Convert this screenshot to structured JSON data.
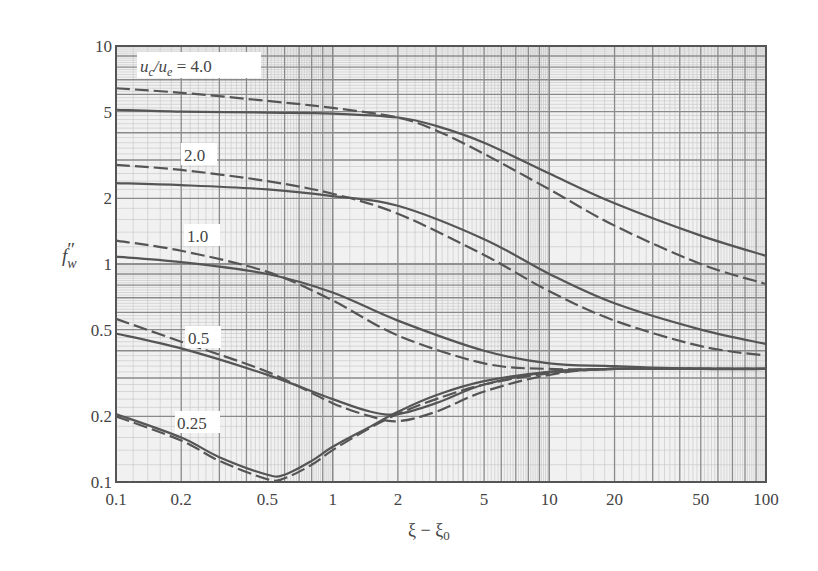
{
  "chart_data": {
    "type": "line",
    "title": "",
    "xlabel": "ξ − ξ0",
    "ylabel": "f''_w",
    "xscale": "log",
    "yscale": "log",
    "xlim": [
      0.1,
      100
    ],
    "ylim": [
      0.1,
      10
    ],
    "grid": true,
    "x_ticks": [
      "0.1",
      "0.2",
      "0.5",
      "1",
      "2",
      "5",
      "10",
      "20",
      "50",
      "100"
    ],
    "y_ticks": [
      "0.1",
      "0.2",
      "0.5",
      "1",
      "2",
      "5",
      "10"
    ],
    "legend_note": "Solid lines and dashed lines are paired for each u_c/u_e value",
    "curve_labels": [
      "u_c/u_e = 4.0",
      "2.0",
      "1.0",
      "0.5",
      "0.25"
    ],
    "series": [
      {
        "name": "u_c/u_e = 4.0 (solid)",
        "style": "solid",
        "x": [
          0.1,
          0.2,
          0.5,
          1,
          2,
          3,
          5,
          10,
          20,
          50,
          100
        ],
        "y": [
          5.1,
          5.0,
          4.95,
          4.9,
          4.7,
          4.3,
          3.6,
          2.6,
          1.9,
          1.35,
          1.09
        ]
      },
      {
        "name": "u_c/u_e = 4.0 (dashed)",
        "style": "dashed",
        "x": [
          0.1,
          0.2,
          0.5,
          1,
          2,
          3,
          5,
          10,
          20,
          50,
          100
        ],
        "y": [
          6.4,
          6.1,
          5.6,
          5.2,
          4.7,
          4.1,
          3.2,
          2.2,
          1.5,
          1.0,
          0.81
        ]
      },
      {
        "name": "u_c/u_e = 2.0 (solid)",
        "style": "solid",
        "x": [
          0.1,
          0.2,
          0.5,
          1,
          2,
          5,
          10,
          20,
          50,
          100
        ],
        "y": [
          2.35,
          2.3,
          2.2,
          2.05,
          1.85,
          1.3,
          0.9,
          0.66,
          0.5,
          0.43
        ]
      },
      {
        "name": "u_c/u_e = 2.0 (dashed)",
        "style": "dashed",
        "x": [
          0.1,
          0.2,
          0.5,
          1,
          2,
          5,
          10,
          20,
          50,
          100
        ],
        "y": [
          2.85,
          2.7,
          2.4,
          2.1,
          1.7,
          1.1,
          0.75,
          0.55,
          0.42,
          0.38
        ]
      },
      {
        "name": "u_c/u_e = 1.0 (solid)",
        "style": "solid",
        "x": [
          0.1,
          0.2,
          0.5,
          1,
          2,
          5,
          10,
          20,
          50,
          100
        ],
        "y": [
          1.08,
          1.02,
          0.9,
          0.74,
          0.55,
          0.4,
          0.35,
          0.34,
          0.33,
          0.33
        ]
      },
      {
        "name": "u_c/u_e = 1.0 (dashed)",
        "style": "dashed",
        "x": [
          0.1,
          0.2,
          0.5,
          1,
          2,
          5,
          10,
          20,
          50,
          100
        ],
        "y": [
          1.28,
          1.15,
          0.92,
          0.68,
          0.47,
          0.35,
          0.33,
          0.33,
          0.33,
          0.33
        ]
      },
      {
        "name": "u_c/u_e = 0.5 (solid)",
        "style": "solid",
        "x": [
          0.1,
          0.2,
          0.5,
          1,
          1.5,
          2,
          3,
          5,
          10,
          20,
          100
        ],
        "y": [
          0.48,
          0.41,
          0.31,
          0.24,
          0.21,
          0.205,
          0.23,
          0.28,
          0.32,
          0.33,
          0.33
        ]
      },
      {
        "name": "u_c/u_e = 0.5 (dashed)",
        "style": "dashed",
        "x": [
          0.1,
          0.2,
          0.5,
          1,
          1.5,
          2,
          3,
          5,
          10,
          20,
          100
        ],
        "y": [
          0.56,
          0.44,
          0.32,
          0.23,
          0.2,
          0.19,
          0.21,
          0.26,
          0.31,
          0.33,
          0.33
        ]
      },
      {
        "name": "u_c/u_e = 0.25 (solid)",
        "style": "solid",
        "x": [
          0.1,
          0.2,
          0.3,
          0.5,
          0.6,
          0.8,
          1,
          1.5,
          2,
          3,
          5,
          10,
          20,
          100
        ],
        "y": [
          0.205,
          0.16,
          0.13,
          0.108,
          0.108,
          0.125,
          0.145,
          0.18,
          0.21,
          0.25,
          0.29,
          0.32,
          0.33,
          0.33
        ]
      },
      {
        "name": "u_c/u_e = 0.25 (dashed)",
        "style": "dashed",
        "x": [
          0.1,
          0.2,
          0.3,
          0.5,
          0.6,
          0.8,
          1,
          1.5,
          2,
          3,
          5,
          10,
          20,
          100
        ],
        "y": [
          0.2,
          0.155,
          0.125,
          0.103,
          0.104,
          0.12,
          0.14,
          0.178,
          0.205,
          0.24,
          0.28,
          0.315,
          0.33,
          0.33
        ]
      }
    ]
  },
  "labels": {
    "ylabel_main": "f",
    "ylabel_prime": "″",
    "ylabel_sub": "w",
    "xlabel_main": "ξ − ξ",
    "xlabel_sub": "0",
    "curve_4_main": "u",
    "curve_4_sub1": "c",
    "curve_4_slash": "/u",
    "curve_4_sub2": "e",
    "curve_4_value": " = 4.0",
    "curve_2": "2.0",
    "curve_1": "1.0",
    "curve_05": "0.5",
    "curve_025": "0.25"
  }
}
